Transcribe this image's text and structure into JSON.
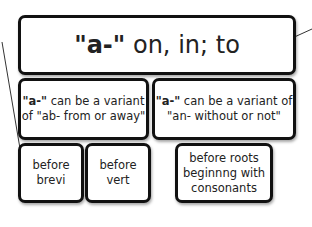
{
  "diagram": {
    "root": {
      "prefix": "\"a-\"",
      "meaning": " on, in; to"
    },
    "variants": [
      {
        "prefix": "\"a-\"",
        "text_line1": " can be a variant",
        "text_line2": "of \"ab- from or away\""
      },
      {
        "prefix": "\"a-\"",
        "text_line1": " can be a variant of",
        "text_line2": "\"an- without or not\""
      }
    ],
    "conditions": [
      {
        "line1": "before",
        "line2": "brevi"
      },
      {
        "line1": "before",
        "line2": "vert"
      },
      {
        "line1": "before roots",
        "line2": "beginnng with",
        "line3": "consonants"
      }
    ]
  }
}
